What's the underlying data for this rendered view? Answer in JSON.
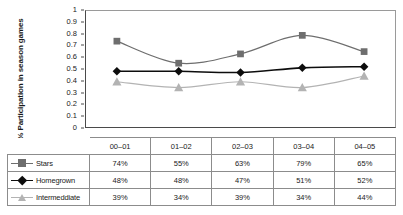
{
  "chart_data": {
    "type": "line",
    "title": "",
    "xlabel": "",
    "ylabel": "% Participation in season games",
    "ylim": [
      0,
      1
    ],
    "ytick_labels": [
      "1",
      "0.9",
      "0.8",
      "0.7",
      "0.6",
      "0.5",
      "0.4",
      "0.3",
      "0.2",
      "0.1",
      "0"
    ],
    "ytick_values": [
      1,
      0.9,
      0.8,
      0.7,
      0.6,
      0.5,
      0.4,
      0.3,
      0.2,
      0.1,
      0
    ],
    "grid": false,
    "legend_position": "table-below",
    "categories": [
      "00–01",
      "01–02",
      "02–03",
      "03–04",
      "04–05"
    ],
    "series": [
      {
        "name": "Stars",
        "values": [
          0.74,
          0.55,
          0.63,
          0.79,
          0.65
        ],
        "labels": [
          "74%",
          "55%",
          "63%",
          "79%",
          "65%"
        ],
        "color": "#6e6e6e",
        "marker": "square"
      },
      {
        "name": "Homegrown",
        "values": [
          0.48,
          0.48,
          0.47,
          0.51,
          0.52
        ],
        "labels": [
          "48%",
          "48%",
          "47%",
          "51%",
          "52%"
        ],
        "color": "#0d0d0d",
        "marker": "diamond"
      },
      {
        "name": "Intermeddiate",
        "values": [
          0.39,
          0.34,
          0.39,
          0.34,
          0.44
        ],
        "labels": [
          "39%",
          "34%",
          "39%",
          "34%",
          "44%"
        ],
        "color": "#b3b3b3",
        "marker": "triangle"
      }
    ]
  },
  "axis": {
    "y_title_line1": "% Participation in season",
    "y_title_line2": "games"
  }
}
